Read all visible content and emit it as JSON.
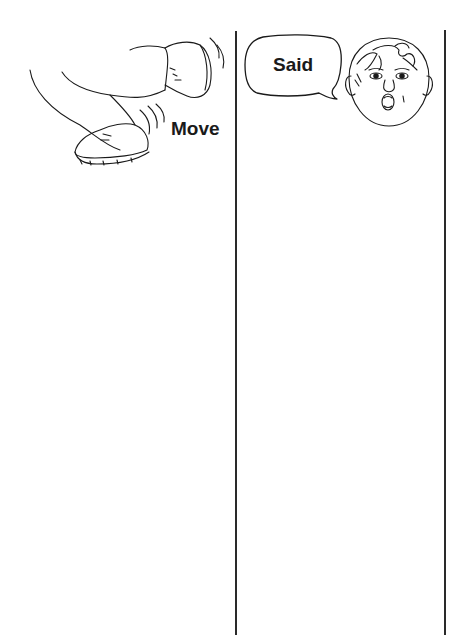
{
  "worksheet": {
    "columns": [
      {
        "label": "Move",
        "illustration": "walking-feet"
      },
      {
        "label": "Said",
        "illustration": "speaking-child-face"
      }
    ]
  },
  "colors": {
    "ink": "#1a1a1a",
    "line": "#2a2a2a",
    "paper": "#ffffff"
  }
}
